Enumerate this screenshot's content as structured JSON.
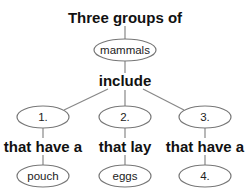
{
  "diagram": {
    "title": "Three groups of",
    "root": "mammals",
    "connector": "include",
    "branches": [
      {
        "group": "1.",
        "relation": "that have a",
        "feature": "pouch"
      },
      {
        "group": "2.",
        "relation": "that lay",
        "feature": "eggs"
      },
      {
        "group": "3.",
        "relation": "that have a",
        "feature": "4."
      }
    ],
    "colors": {
      "line": "#888888",
      "text": "#111111",
      "ellipse_stroke": "#777777"
    }
  }
}
